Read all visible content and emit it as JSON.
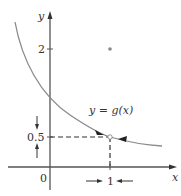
{
  "figure": {
    "type": "limit-graph",
    "function_label": "y = g(x)",
    "axis_labels": {
      "x": "x",
      "y": "y"
    },
    "origin_label": "0",
    "y_ticks": [
      {
        "value": 2,
        "label": "2"
      },
      {
        "value": 0.5,
        "label": "0.5"
      }
    ],
    "x_ticks": [
      {
        "value": 1,
        "label": "1"
      }
    ],
    "isolated_point": {
      "x": 1,
      "y": 2
    },
    "limit": {
      "x_approaches": 1,
      "value": 0.5
    },
    "colors": {
      "axes": "#555555",
      "curve": "#8a8a8a",
      "dashed": "#333333",
      "text": "#333333",
      "point": "#888888"
    }
  }
}
